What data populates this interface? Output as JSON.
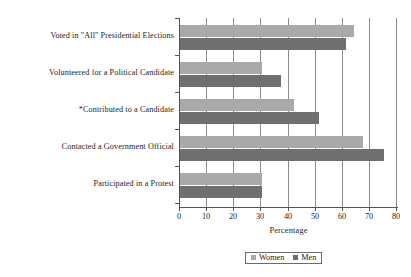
{
  "chart_data": {
    "type": "bar",
    "orientation": "horizontal",
    "title": "",
    "xlabel": "Percentage",
    "ylabel": "",
    "xlim": [
      0,
      80
    ],
    "xticks": [
      0,
      10,
      20,
      30,
      40,
      50,
      60,
      70,
      80
    ],
    "grid": true,
    "legend_position": "bottom",
    "categories": [
      "Voted in \"All\" Presidential Elections",
      "Volunteered for a Political Candidate",
      "*Contributed to a Candidate",
      "Contacted a Government Official",
      "Participated in a Protest"
    ],
    "series": [
      {
        "name": "Women",
        "color": "#a9a9a9",
        "values": [
          64,
          30,
          42,
          67,
          30
        ]
      },
      {
        "name": "Men",
        "color": "#6f6f6f",
        "values": [
          61,
          37,
          51,
          75,
          30
        ]
      }
    ]
  },
  "legend": {
    "items": [
      {
        "label": "Women",
        "swatch": "women-swatch"
      },
      {
        "label": "Men",
        "swatch": "men-swatch"
      }
    ]
  },
  "axis": {
    "x_title": "Percentage"
  }
}
